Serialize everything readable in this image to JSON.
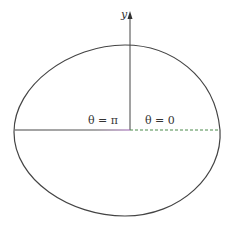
{
  "figure": {
    "axis_label_y": "y",
    "label_theta_pi": "θ = π",
    "label_theta_zero": "θ = 0",
    "colors": {
      "curve": "#444444",
      "axis": "#444444",
      "ray_pi": "#444444",
      "ray_pi_end": "#9a5fb0",
      "ray_zero_dashed": "#4a8a4a"
    }
  }
}
